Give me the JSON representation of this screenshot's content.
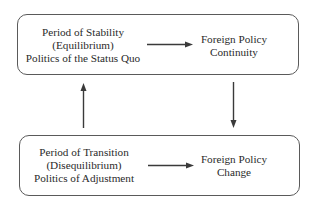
{
  "diagram": {
    "top_box": {
      "left_lines": [
        "Period of Stability",
        "(Equilibrium)",
        "Politics of the Status Quo"
      ],
      "right_lines": [
        "Foreign Policy",
        "Continuity"
      ]
    },
    "bottom_box": {
      "left_lines": [
        "Period of Transition",
        "(Disequilibrium)",
        "Politics of Adjustment"
      ],
      "right_lines": [
        "Foreign Policy",
        "Change"
      ]
    },
    "edges": [
      {
        "from": "Period of Stability",
        "to": "Foreign Policy Continuity"
      },
      {
        "from": "Foreign Policy Continuity",
        "to": "Period of Transition"
      },
      {
        "from": "Period of Transition",
        "to": "Foreign Policy Change"
      },
      {
        "from": "Period of Transition",
        "to": "Period of Stability"
      }
    ],
    "line_color": "#3a3a3a",
    "border_color": "#5a5a5a"
  }
}
